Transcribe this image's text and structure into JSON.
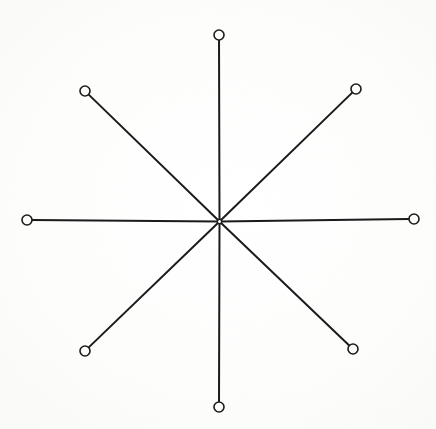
{
  "figure": {
    "title": "Eight-spoke radial line figure",
    "kind": "line-drawing",
    "caption": "",
    "background_color": "#ffffff",
    "ink_color": "#1b1b1b",
    "node_fill_color": "#ffffff",
    "canvas": {
      "width": 436,
      "height": 429
    },
    "center": {
      "label": "hub",
      "x": 219.5,
      "y": 221.5,
      "radius": 2.2
    },
    "node_radius": 5.0,
    "node_stroke_width": 1.6,
    "spoke_stroke_width": 2.0,
    "spoke_count": 8,
    "spokes": [
      {
        "id": "spoke-n",
        "label": "north",
        "angle_deg": 90,
        "length_px": 187,
        "end_x": 219,
        "end_y": 35
      },
      {
        "id": "spoke-ne",
        "label": "north-east",
        "angle_deg": 45,
        "length_px": 180,
        "end_x": 356,
        "end_y": 89
      },
      {
        "id": "spoke-e",
        "label": "east",
        "angle_deg": 0,
        "length_px": 195,
        "end_x": 414,
        "end_y": 219
      },
      {
        "id": "spoke-se",
        "label": "south-east",
        "angle_deg": -45,
        "length_px": 190,
        "end_x": 353,
        "end_y": 349
      },
      {
        "id": "spoke-s",
        "label": "south",
        "angle_deg": -90,
        "length_px": 186,
        "end_x": 219,
        "end_y": 407
      },
      {
        "id": "spoke-sw",
        "label": "south-west",
        "angle_deg": -135,
        "length_px": 184,
        "end_x": 85,
        "end_y": 351
      },
      {
        "id": "spoke-w",
        "label": "west",
        "angle_deg": 180,
        "length_px": 193,
        "end_x": 27,
        "end_y": 220
      },
      {
        "id": "spoke-nw",
        "label": "north-west",
        "angle_deg": 135,
        "length_px": 185,
        "end_x": 85,
        "end_y": 91
      }
    ]
  }
}
